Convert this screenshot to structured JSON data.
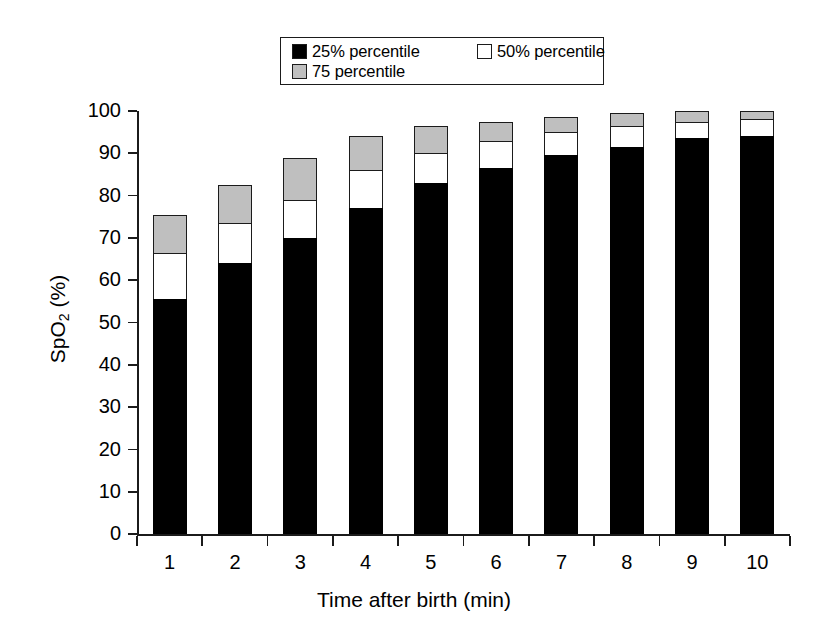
{
  "chart_data": {
    "type": "bar",
    "subtype": "stacked-percentile-bars",
    "title": "",
    "xlabel": "Time after birth (min)",
    "ylabel": "SpO2 (%)",
    "ylabel_parts": {
      "pre": "SpO",
      "sub": "2",
      "post": " (%)"
    },
    "categories": [
      "1",
      "2",
      "3",
      "4",
      "5",
      "6",
      "7",
      "8",
      "9",
      "10"
    ],
    "ylim": [
      0,
      100
    ],
    "yticks": [
      0,
      10,
      20,
      30,
      40,
      50,
      60,
      70,
      80,
      90,
      100
    ],
    "ytick_labels": [
      "0",
      "10",
      "20",
      "30",
      "40",
      "50",
      "60",
      "70",
      "80",
      "90",
      "100"
    ],
    "grid": false,
    "legend_position": "top-center",
    "series": [
      {
        "name": "25% percentile",
        "color": "#000000",
        "values": [
          55.5,
          64.0,
          70.0,
          77.0,
          83.0,
          86.5,
          89.5,
          91.5,
          93.5,
          94.0
        ]
      },
      {
        "name": "50% percentile",
        "color": "#ffffff",
        "values": [
          66.5,
          73.5,
          79.0,
          86.0,
          90.0,
          93.0,
          95.0,
          96.5,
          97.5,
          98.0
        ]
      },
      {
        "name": "75 percentile",
        "color": "#bfbfbf",
        "values": [
          75.5,
          82.5,
          89.0,
          94.0,
          96.5,
          97.5,
          98.5,
          99.5,
          100.0,
          100.0
        ]
      }
    ]
  },
  "legend": {
    "entries": [
      {
        "label": "25% percentile",
        "swatch": "p25"
      },
      {
        "label": "50% percentile",
        "swatch": "p50"
      },
      {
        "label": "75 percentile",
        "swatch": "p75"
      }
    ]
  },
  "colors": {
    "p25": "#000000",
    "p50": "#ffffff",
    "p75": "#bfbfbf",
    "axis": "#1b1b1b",
    "background": "#ffffff"
  }
}
